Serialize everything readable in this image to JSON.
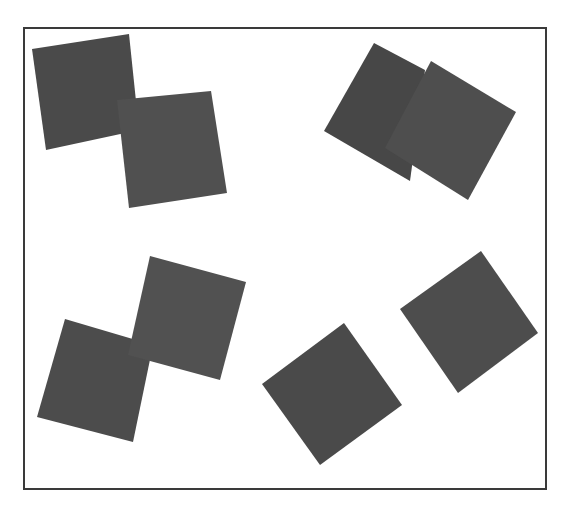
{
  "canvas": {
    "width": 572,
    "height": 514,
    "background": "#ffffff"
  },
  "frame": {
    "x": 24,
    "y": 28,
    "width": 522,
    "height": 461,
    "stroke": "#3a3a3a",
    "stroke_width": 2
  },
  "squares": [
    {
      "id": "square-1",
      "fill": "#4a4a4a",
      "points": [
        [
          32,
          49
        ],
        [
          129,
          34
        ],
        [
          139,
          130
        ],
        [
          46,
          150
        ]
      ]
    },
    {
      "id": "square-2",
      "fill": "#505050",
      "points": [
        [
          117,
          100
        ],
        [
          211,
          91
        ],
        [
          227,
          193
        ],
        [
          129,
          208
        ]
      ]
    },
    {
      "id": "square-3",
      "fill": "#474747",
      "points": [
        [
          374,
          43
        ],
        [
          425,
          70
        ],
        [
          410,
          181
        ],
        [
          324,
          131
        ]
      ]
    },
    {
      "id": "square-4",
      "fill": "#4e4e4e",
      "points": [
        [
          431,
          61
        ],
        [
          516,
          112
        ],
        [
          468,
          200
        ],
        [
          385,
          148
        ]
      ]
    },
    {
      "id": "square-5",
      "fill": "#4c4c4c",
      "points": [
        [
          65,
          319
        ],
        [
          153,
          345
        ],
        [
          133,
          442
        ],
        [
          37,
          417
        ]
      ]
    },
    {
      "id": "square-6",
      "fill": "#515151",
      "points": [
        [
          150,
          256
        ],
        [
          246,
          282
        ],
        [
          220,
          380
        ],
        [
          128,
          355
        ]
      ]
    },
    {
      "id": "square-7",
      "fill": "#4a4a4a",
      "points": [
        [
          344,
          323
        ],
        [
          402,
          405
        ],
        [
          320,
          465
        ],
        [
          262,
          384
        ]
      ]
    },
    {
      "id": "square-8",
      "fill": "#4d4d4d",
      "points": [
        [
          481,
          251
        ],
        [
          538,
          333
        ],
        [
          458,
          393
        ],
        [
          400,
          309
        ]
      ]
    }
  ]
}
